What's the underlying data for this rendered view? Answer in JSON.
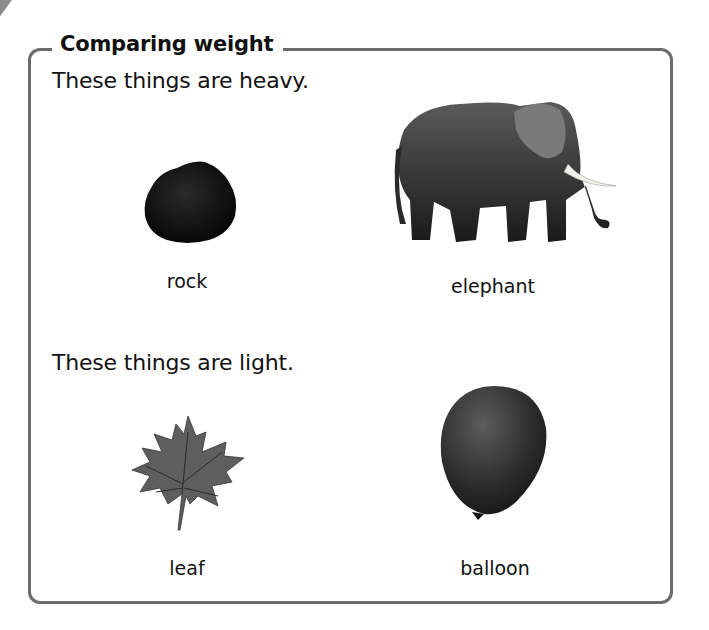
{
  "section": {
    "title": "Comparing weight",
    "heavy_heading": "These things are heavy.",
    "light_heading": "These things are light.",
    "heavy_items": [
      {
        "label": "rock",
        "icon": "rock-icon"
      },
      {
        "label": "elephant",
        "icon": "elephant-icon"
      }
    ],
    "light_items": [
      {
        "label": "leaf",
        "icon": "leaf-icon"
      },
      {
        "label": "balloon",
        "icon": "balloon-icon"
      }
    ]
  },
  "colors": {
    "border": "#6b6b6b",
    "text": "#111111",
    "corner_tab": "#8c8c8c"
  }
}
